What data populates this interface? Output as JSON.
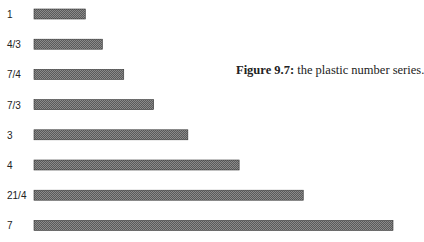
{
  "caption": {
    "label": "Figure 9.7:",
    "text": " the plastic number series."
  },
  "colors": {
    "bar": "#5a5a5a",
    "bar_pattern_light": "#8a8a8a",
    "bar_border": "#333333"
  },
  "chart_data": {
    "type": "bar",
    "orientation": "horizontal",
    "title": "Figure 9.7: the plastic number series.",
    "xlabel": "",
    "ylabel": "",
    "categories": [
      "1",
      "4/3",
      "7/4",
      "7/3",
      "3",
      "4",
      "21/4",
      "7"
    ],
    "values": [
      1,
      1.3333,
      1.75,
      2.3333,
      3,
      4,
      5.25,
      7
    ],
    "xlim": [
      0,
      7
    ],
    "grid": false,
    "legend": "none"
  }
}
